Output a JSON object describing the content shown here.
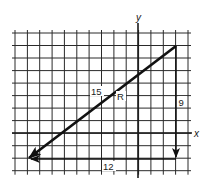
{
  "diagram": {
    "type": "vector-addition",
    "axes": {
      "x_label": "x",
      "y_label": "y"
    },
    "grid": {
      "x_lines": [
        15,
        27.4,
        39.7,
        52.1,
        64.4,
        76.8,
        89.1,
        101.5,
        113.9,
        126.2,
        138.6,
        150.9,
        163.3,
        175.6,
        188
      ],
      "y_lines": [
        33,
        45.5,
        58,
        70.6,
        83.1,
        95.6,
        108.1,
        120.6,
        133.2,
        145.7,
        158.2,
        170.7
      ],
      "x_axis_y": 133,
      "y_axis_x": 138
    },
    "vectors": [
      {
        "name": "vertical",
        "label": "9",
        "from": [
          176,
          46
        ],
        "to": [
          176,
          158
        ]
      },
      {
        "name": "horizontal",
        "label": "12",
        "from": [
          176,
          159
        ],
        "to": [
          29,
          159
        ]
      },
      {
        "name": "resultant",
        "label": "15",
        "symbol": "R",
        "from": [
          176,
          46
        ],
        "to": [
          28,
          159
        ]
      }
    ],
    "labels": {
      "y": "y",
      "x": "x",
      "resultant_magnitude": "15",
      "resultant_symbol": "R",
      "vertical_magnitude": "9",
      "horizontal_magnitude": "12"
    },
    "colors": {
      "grid": "#2a2a2a",
      "vector": "#111111",
      "background": "#ffffff"
    }
  }
}
